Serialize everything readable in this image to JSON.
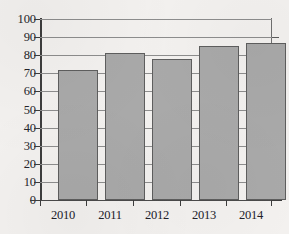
{
  "chart_data": {
    "type": "bar",
    "title": "",
    "subtitle": "",
    "xlabel": "",
    "ylabel": "",
    "categories": [
      "2010",
      "2011",
      "2012",
      "2013",
      "2014"
    ],
    "values": [
      72,
      81,
      78,
      85,
      87
    ],
    "series": [
      {
        "name": "",
        "values": [
          72,
          81,
          78,
          85,
          87
        ]
      }
    ],
    "ylim": [
      0,
      100
    ],
    "ytick_labels": [
      "0",
      "10",
      "20",
      "30",
      "40",
      "50",
      "60",
      "70",
      "80",
      "90",
      "100"
    ],
    "ytick_values": [
      0,
      10,
      20,
      30,
      40,
      50,
      60,
      70,
      80,
      90,
      100
    ],
    "grid": true,
    "grid_axis": "y",
    "legend": false,
    "legend_position": "none",
    "annotations": [],
    "colors": {
      "bar_fill": "#a9a9a9",
      "bar_border": "#5e5e5e",
      "gridline": "#8d8d8d",
      "axis": "#3d3d3d",
      "background": "#f3f1ef",
      "plot_background": "#f7f6f4",
      "text": "#20202a"
    }
  }
}
